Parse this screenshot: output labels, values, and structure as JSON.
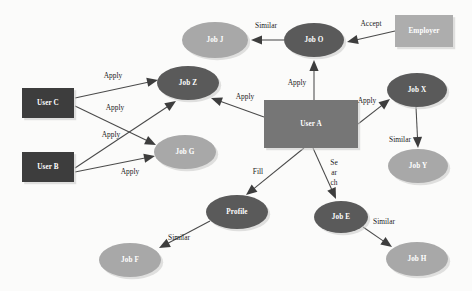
{
  "diagram": {
    "canvas": {
      "width": 472,
      "height": 291,
      "background": "#fbfbfa"
    },
    "palette": {
      "node_dark": "#5a5a5a",
      "node_light": "#a8a8a8",
      "rect_user_dark": "#3d3d3d",
      "rect_user_a": "#767676",
      "rect_employer": "#adadad",
      "edge": "#4a4a4a",
      "label_text": "#1c1c1c",
      "node_text": "#ffffff"
    },
    "nodes": [
      {
        "id": "jobJ",
        "label": "Job J",
        "shape": "ellipse",
        "cx": 215,
        "cy": 40,
        "rx": 33,
        "ry": 18,
        "fill": "#a8a8a8",
        "text_fill": "#2b2b2b"
      },
      {
        "id": "jobO",
        "label": "Job O",
        "shape": "ellipse",
        "cx": 314,
        "cy": 40,
        "rx": 30,
        "ry": 17,
        "fill": "#5a5a5a",
        "text_fill": "#ffffff"
      },
      {
        "id": "employer",
        "label": "Employer",
        "shape": "rectangle",
        "cx": 424,
        "cy": 31,
        "rx": 29,
        "ry": 16,
        "fill": "#adadad",
        "text_fill": "#2b2b2b"
      },
      {
        "id": "jobZ",
        "label": "Job Z",
        "shape": "ellipse",
        "cx": 188,
        "cy": 83,
        "rx": 31,
        "ry": 17,
        "fill": "#5a5a5a",
        "text_fill": "#ffffff"
      },
      {
        "id": "jobX",
        "label": "Job X",
        "shape": "ellipse",
        "cx": 417,
        "cy": 90,
        "rx": 30,
        "ry": 17,
        "fill": "#5a5a5a",
        "text_fill": "#ffffff"
      },
      {
        "id": "userC",
        "label": "User C",
        "shape": "rectangle",
        "cx": 48,
        "cy": 103,
        "rx": 26,
        "ry": 15,
        "fill": "#3d3d3d",
        "text_fill": "#ffffff"
      },
      {
        "id": "userA",
        "label": "User A",
        "shape": "rectangle",
        "cx": 311,
        "cy": 124,
        "rx": 47,
        "ry": 24,
        "fill": "#767676",
        "text_fill": "#ffffff"
      },
      {
        "id": "jobG",
        "label": "Job G",
        "shape": "ellipse",
        "cx": 185,
        "cy": 152,
        "rx": 31,
        "ry": 17,
        "fill": "#a8a8a8",
        "text_fill": "#2b2b2b"
      },
      {
        "id": "jobY",
        "label": "Job Y",
        "shape": "ellipse",
        "cx": 418,
        "cy": 166,
        "rx": 30,
        "ry": 17,
        "fill": "#a8a8a8",
        "text_fill": "#2b2b2b"
      },
      {
        "id": "userB",
        "label": "User B",
        "shape": "rectangle",
        "cx": 48,
        "cy": 167,
        "rx": 26,
        "ry": 15,
        "fill": "#3d3d3d",
        "text_fill": "#ffffff"
      },
      {
        "id": "profile",
        "label": "Profile",
        "shape": "ellipse",
        "cx": 237,
        "cy": 212,
        "rx": 31,
        "ry": 17,
        "fill": "#5a5a5a",
        "text_fill": "#ffffff"
      },
      {
        "id": "jobE",
        "label": "Job E",
        "shape": "ellipse",
        "cx": 341,
        "cy": 217,
        "rx": 27,
        "ry": 16,
        "fill": "#5a5a5a",
        "text_fill": "#ffffff"
      },
      {
        "id": "jobF",
        "label": "Job F",
        "shape": "ellipse",
        "cx": 130,
        "cy": 260,
        "rx": 31,
        "ry": 17,
        "fill": "#a8a8a8",
        "text_fill": "#2b2b2b"
      },
      {
        "id": "jobH",
        "label": "Job H",
        "shape": "ellipse",
        "cx": 417,
        "cy": 259,
        "rx": 31,
        "ry": 17,
        "fill": "#a8a8a8",
        "text_fill": "#2b2b2b"
      }
    ],
    "edges": [
      {
        "id": "e-jobO-jobJ",
        "from": "jobO",
        "to": "jobJ",
        "label": "Similar",
        "label_x": 266,
        "label_y": 26,
        "x1": 284,
        "y1": 40,
        "x2": 251,
        "y2": 40
      },
      {
        "id": "e-employer-jobO",
        "from": "employer",
        "to": "jobO",
        "label": "Accept",
        "label_x": 371,
        "label_y": 24,
        "x1": 395,
        "y1": 31,
        "x2": 347,
        "y2": 42
      },
      {
        "id": "e-userA-jobO",
        "from": "userA",
        "to": "jobO",
        "label": "Apply",
        "label_x": 297,
        "label_y": 83,
        "x1": 314,
        "y1": 100,
        "x2": 314,
        "y2": 60
      },
      {
        "id": "e-userC-jobZ",
        "from": "userC",
        "to": "jobZ",
        "label": "Apply",
        "label_x": 113,
        "label_y": 76,
        "x1": 75,
        "y1": 98,
        "x2": 158,
        "y2": 80
      },
      {
        "id": "e-userC-jobG",
        "from": "userC",
        "to": "jobG",
        "label": "Apply",
        "label_x": 115,
        "label_y": 108,
        "x1": 75,
        "y1": 106,
        "x2": 156,
        "y2": 145
      },
      {
        "id": "e-userB-jobZ",
        "from": "userB",
        "to": "jobZ",
        "label": "Apply",
        "label_x": 111,
        "label_y": 135,
        "x1": 75,
        "y1": 168,
        "x2": 176,
        "y2": 101
      },
      {
        "id": "e-userB-jobG",
        "from": "userB",
        "to": "jobG",
        "label": "Apply",
        "label_x": 130,
        "label_y": 172,
        "x1": 75,
        "y1": 172,
        "x2": 155,
        "y2": 156
      },
      {
        "id": "e-userA-jobZ",
        "from": "userA",
        "to": "jobZ",
        "label": "Apply",
        "label_x": 245,
        "label_y": 97,
        "x1": 264,
        "y1": 117,
        "x2": 211,
        "y2": 98
      },
      {
        "id": "e-userA-jobX",
        "from": "userA",
        "to": "jobX",
        "label": "Apply",
        "label_x": 367,
        "label_y": 101,
        "x1": 358,
        "y1": 124,
        "x2": 390,
        "y2": 99
      },
      {
        "id": "e-jobX-jobY",
        "from": "jobX",
        "to": "jobY",
        "label": "Similar",
        "label_x": 400,
        "label_y": 140,
        "x1": 416,
        "y1": 107,
        "x2": 418,
        "y2": 148
      },
      {
        "id": "e-userA-profile",
        "from": "userA",
        "to": "profile",
        "label": "Fill",
        "label_x": 258,
        "label_y": 172,
        "x1": 304,
        "y1": 148,
        "x2": 246,
        "y2": 195
      },
      {
        "id": "e-userA-jobE",
        "from": "userA",
        "to": "jobE",
        "label": "",
        "label_x": 0,
        "label_y": 0,
        "x1": 313,
        "y1": 148,
        "x2": 336,
        "y2": 199
      },
      {
        "id": "e-profile-jobF",
        "from": "profile",
        "to": "jobF",
        "label": "Similar",
        "label_x": 179,
        "label_y": 238,
        "x1": 210,
        "y1": 221,
        "x2": 159,
        "y2": 248
      },
      {
        "id": "e-jobE-jobH",
        "from": "jobE",
        "to": "jobH",
        "label": "Similar",
        "label_x": 384,
        "label_y": 222,
        "x1": 363,
        "y1": 227,
        "x2": 392,
        "y2": 247
      }
    ],
    "stacked_labels": [
      {
        "id": "search-label",
        "lines": [
          "Se",
          "ar",
          "ch"
        ],
        "x": 334,
        "y": 163,
        "line_height": 10
      }
    ]
  }
}
